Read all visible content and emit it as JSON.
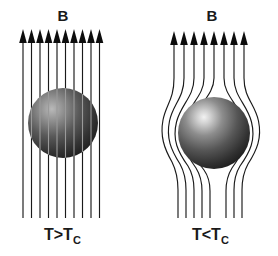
{
  "figure": {
    "background_color": "#ffffff",
    "line_color": "#1a1a1a",
    "sphere_dark_color": "#2b2b2b",
    "sphere_light_color": "#d8d8d8",
    "width": 278,
    "height": 256
  },
  "panels": [
    {
      "id": "normal-state",
      "field_label": "B",
      "condition_label": "T>T",
      "condition_subscript": "C",
      "condition_full": "T>Tc",
      "field_line_count": 10,
      "field_lines_penetrate_sphere": true,
      "sphere": {
        "center_x": 63,
        "center_y": 123,
        "radius": 35,
        "highlight_x": 50,
        "highlight_y": 108
      },
      "arrow_tip_y": 30,
      "line_bottom_y": 218,
      "line_x_positions": [
        23,
        32,
        41,
        50,
        59,
        68,
        77,
        86,
        94,
        99
      ]
    },
    {
      "id": "superconducting-state",
      "field_label": "B",
      "condition_label": "T<T",
      "condition_subscript": "C",
      "condition_full": "T<Tc",
      "field_line_count": 8,
      "field_lines_penetrate_sphere": false,
      "sphere": {
        "center_x": 214,
        "center_y": 133,
        "radius": 36,
        "highlight_x": 201,
        "highlight_y": 115
      },
      "arrow_tip_y": 32,
      "line_bottom_y": 218,
      "line_x_positions": [
        174,
        184,
        194,
        204,
        214,
        224,
        234,
        244
      ]
    }
  ],
  "labels": {
    "left_field": {
      "text": "B",
      "x": 63,
      "y": 20
    },
    "right_field": {
      "text": "B",
      "x": 212,
      "y": 20
    },
    "left_condition": {
      "text": "T>T",
      "subscript": "C",
      "x": 44,
      "y": 240
    },
    "right_condition": {
      "text": "T<T",
      "subscript": "C",
      "x": 192,
      "y": 240
    }
  }
}
